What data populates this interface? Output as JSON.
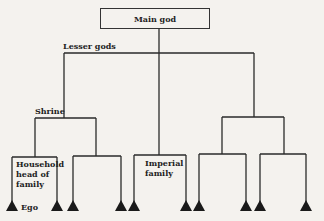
{
  "diagram": {
    "nodes": {
      "main_god": "Main god",
      "lesser_gods": "Lesser gods",
      "shrine": "Shrine",
      "household": "Household\nhead of\nfamily",
      "household_lines": [
        "Household",
        "head of",
        "family"
      ],
      "imperial_lines": [
        "Imperial",
        "family"
      ],
      "ego": "Ego"
    },
    "colors": {
      "line": "#2a2a2a",
      "background": "#f4f2ee",
      "text": "#222222"
    },
    "leaf_count": 10
  }
}
